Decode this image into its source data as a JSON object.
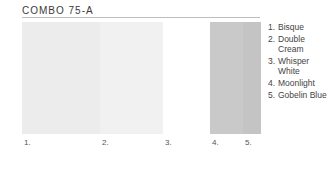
{
  "title": "COMBO 75-A",
  "swatches": [
    {
      "number": "1.",
      "name": "Bisque",
      "color": "#ececec"
    },
    {
      "number": "2.",
      "name": "Double Cream",
      "color": "#f1f1f1"
    },
    {
      "number": "3.",
      "name": "Whisper White",
      "color": "#ffffff"
    },
    {
      "number": "4.",
      "name": "Moonlight",
      "color": "#c9c9c9"
    },
    {
      "number": "5.",
      "name": "Gobelin Blue",
      "color": "#c4c4c4"
    }
  ],
  "legend": [
    {
      "number": "1.",
      "label": "Bisque"
    },
    {
      "number": "2.",
      "label": "Double Cream"
    },
    {
      "number": "3.",
      "label": "Whisper White"
    },
    {
      "number": "4.",
      "label": "Moonlight"
    },
    {
      "number": "5.",
      "label": "Gobelin Blue"
    }
  ]
}
